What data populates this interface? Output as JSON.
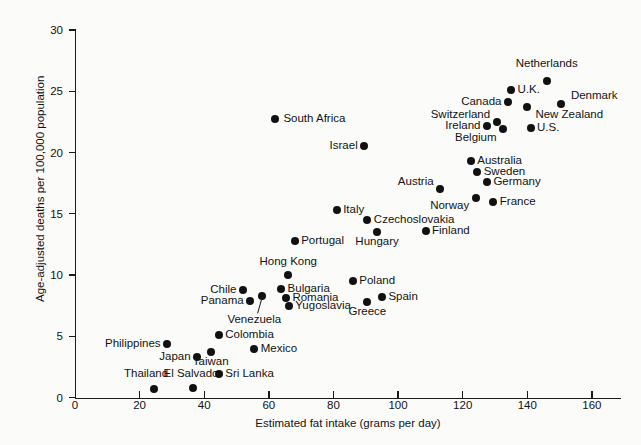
{
  "chart_data": {
    "type": "scatter",
    "title": "",
    "xlabel": "Estimated fat intake (grams per day)",
    "ylabel": "Age-adjusted deaths per 100,000 population",
    "xlim": [
      0,
      169
    ],
    "ylim": [
      0,
      30
    ],
    "xticks": [
      0,
      20,
      40,
      60,
      80,
      100,
      120,
      140,
      160
    ],
    "yticks": [
      0,
      5,
      10,
      15,
      20,
      25,
      30
    ],
    "grid": false,
    "legend": "none",
    "marker": "filled-circle",
    "marker_color": "#111111",
    "points": [
      {
        "label": "Netherlands",
        "x": 146.0,
        "y": 25.8,
        "lx": 146.0,
        "ly": 27.2,
        "anchor": "ctr"
      },
      {
        "label": "Denmark",
        "x": 150.5,
        "y": 24.0,
        "lx": 153.5,
        "ly": 24.6,
        "anchor": "right"
      },
      {
        "label": "U.K.",
        "x": 135.0,
        "y": 25.1,
        "lx": 137.0,
        "ly": 25.1,
        "anchor": "right"
      },
      {
        "label": "Canada",
        "x": 134.0,
        "y": 24.1,
        "lx": 132.0,
        "ly": 24.1,
        "anchor": "left"
      },
      {
        "label": "New Zealand",
        "x": 140.0,
        "y": 23.7,
        "lx": 142.5,
        "ly": 23.1,
        "anchor": "right"
      },
      {
        "label": "Switzerland",
        "x": 130.5,
        "y": 22.5,
        "lx": 128.5,
        "ly": 23.1,
        "anchor": "left"
      },
      {
        "label": "Ireland",
        "x": 127.5,
        "y": 22.2,
        "lx": 125.5,
        "ly": 22.2,
        "anchor": "left"
      },
      {
        "label": "Belgium",
        "x": 132.5,
        "y": 21.9,
        "lx": 130.5,
        "ly": 21.2,
        "anchor": "left"
      },
      {
        "label": "U.S.",
        "x": 141.0,
        "y": 22.0,
        "lx": 143.0,
        "ly": 22.0,
        "anchor": "right"
      },
      {
        "label": "Australia",
        "x": 122.5,
        "y": 19.3,
        "lx": 124.5,
        "ly": 19.3,
        "anchor": "right"
      },
      {
        "label": "Sweden",
        "x": 124.5,
        "y": 18.4,
        "lx": 126.5,
        "ly": 18.4,
        "anchor": "right"
      },
      {
        "label": "Germany",
        "x": 127.5,
        "y": 17.6,
        "lx": 129.5,
        "ly": 17.6,
        "anchor": "right"
      },
      {
        "label": "Austria",
        "x": 113.0,
        "y": 17.0,
        "lx": 111.0,
        "ly": 17.6,
        "anchor": "left"
      },
      {
        "label": "Norway",
        "x": 124.0,
        "y": 16.3,
        "lx": 122.0,
        "ly": 15.6,
        "anchor": "left"
      },
      {
        "label": "France",
        "x": 129.5,
        "y": 16.0,
        "lx": 131.5,
        "ly": 16.0,
        "anchor": "right"
      },
      {
        "label": "South Africa",
        "x": 62.0,
        "y": 22.7,
        "lx": 64.5,
        "ly": 22.7,
        "anchor": "right"
      },
      {
        "label": "Israel",
        "x": 89.5,
        "y": 20.5,
        "lx": 87.5,
        "ly": 20.5,
        "anchor": "left"
      },
      {
        "label": "Italy",
        "x": 81.0,
        "y": 15.3,
        "lx": 83.0,
        "ly": 15.3,
        "anchor": "right"
      },
      {
        "label": "Czechoslovakia",
        "x": 90.5,
        "y": 14.5,
        "lx": 92.5,
        "ly": 14.5,
        "anchor": "right"
      },
      {
        "label": "Hungary",
        "x": 93.5,
        "y": 13.5,
        "lx": 93.5,
        "ly": 12.7,
        "anchor": "ctr"
      },
      {
        "label": "Finland",
        "x": 108.5,
        "y": 13.6,
        "lx": 110.5,
        "ly": 13.6,
        "anchor": "right"
      },
      {
        "label": "Portugal",
        "x": 68.0,
        "y": 12.8,
        "lx": 70.0,
        "ly": 12.8,
        "anchor": "right"
      },
      {
        "label": "Hong Kong",
        "x": 66.0,
        "y": 10.0,
        "lx": 66.0,
        "ly": 11.1,
        "anchor": "ctr"
      },
      {
        "label": "Poland",
        "x": 86.0,
        "y": 9.5,
        "lx": 88.0,
        "ly": 9.5,
        "anchor": "right"
      },
      {
        "label": "Bulgaria",
        "x": 63.8,
        "y": 8.9,
        "lx": 65.8,
        "ly": 8.9,
        "anchor": "right"
      },
      {
        "label": "Romania",
        "x": 65.3,
        "y": 8.1,
        "lx": 67.3,
        "ly": 8.1,
        "anchor": "right"
      },
      {
        "label": "Yugoslavia",
        "x": 66.2,
        "y": 7.5,
        "lx": 68.2,
        "ly": 7.5,
        "anchor": "right"
      },
      {
        "label": "Chile",
        "x": 52.0,
        "y": 8.8,
        "lx": 50.0,
        "ly": 8.8,
        "anchor": "left"
      },
      {
        "label": "Panama",
        "x": 54.2,
        "y": 7.9,
        "lx": 52.2,
        "ly": 7.9,
        "anchor": "left"
      },
      {
        "label": "Venezuela",
        "x": 58.0,
        "y": 8.3,
        "lx": 55.5,
        "ly": 6.3,
        "anchor": "ctr"
      },
      {
        "label": "Spain",
        "x": 95.0,
        "y": 8.2,
        "lx": 97.0,
        "ly": 8.2,
        "anchor": "right"
      },
      {
        "label": "Greece",
        "x": 90.5,
        "y": 7.8,
        "lx": 90.5,
        "ly": 7.0,
        "anchor": "ctr"
      },
      {
        "label": "Colombia",
        "x": 44.5,
        "y": 5.1,
        "lx": 46.5,
        "ly": 5.1,
        "anchor": "right"
      },
      {
        "label": "Philippines",
        "x": 28.5,
        "y": 4.4,
        "lx": 26.5,
        "ly": 4.4,
        "anchor": "left"
      },
      {
        "label": "Mexico",
        "x": 55.5,
        "y": 4.0,
        "lx": 57.5,
        "ly": 4.0,
        "anchor": "right"
      },
      {
        "label": "Taiwan",
        "x": 42.0,
        "y": 3.7,
        "lx": 42.0,
        "ly": 2.9,
        "anchor": "ctr"
      },
      {
        "label": "Japan",
        "x": 37.8,
        "y": 3.3,
        "lx": 35.8,
        "ly": 3.3,
        "anchor": "left"
      },
      {
        "label": "Sri Lanka",
        "x": 44.5,
        "y": 1.9,
        "lx": 46.5,
        "ly": 1.9,
        "anchor": "right"
      },
      {
        "label": "El Salvador",
        "x": 36.5,
        "y": 0.8,
        "lx": 36.5,
        "ly": 1.9,
        "anchor": "ctr"
      },
      {
        "label": "Thailand",
        "x": 24.5,
        "y": 0.7,
        "lx": 22.0,
        "ly": 1.9,
        "anchor": "ctr"
      }
    ],
    "leaders": [
      {
        "from_x": 58.0,
        "from_y": 8.3,
        "to_x": 56.5,
        "to_y": 6.9
      }
    ]
  }
}
